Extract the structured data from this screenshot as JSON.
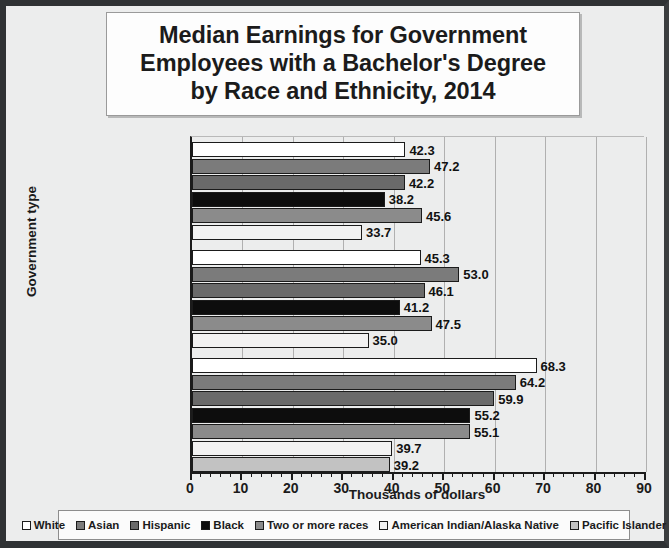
{
  "chart_data": {
    "type": "bar",
    "orientation": "horizontal",
    "title_lines": [
      "Median Earnings for Government",
      "Employees with a Bachelor's Degree",
      "by Race and Ethnicity, 2014"
    ],
    "xlabel": "Thousands of dollars",
    "ylabel": "Government type",
    "categories": [
      "State government",
      "Local government",
      "Federal government"
    ],
    "xlim": [
      0,
      90
    ],
    "xticks": [
      0,
      10,
      20,
      30,
      40,
      50,
      60,
      70,
      80,
      90
    ],
    "xtick_labels": [
      "0",
      "10",
      "20",
      "30",
      "40",
      "50",
      "60",
      "70",
      "80",
      "90"
    ],
    "minor_tick_step": 2,
    "grid": true,
    "grid_axis": "x",
    "legend_position": "bottom",
    "series": [
      {
        "name": "White",
        "color": "#ffffff",
        "values": [
          42.3,
          45.3,
          68.3
        ]
      },
      {
        "name": "Asian",
        "color": "#7b7b7b",
        "values": [
          47.2,
          53.0,
          64.2
        ]
      },
      {
        "name": "Hispanic",
        "color": "#6a6a6a",
        "values": [
          42.2,
          46.1,
          59.9
        ]
      },
      {
        "name": "Black",
        "color": "#0d0d0d",
        "values": [
          38.2,
          41.2,
          55.2
        ]
      },
      {
        "name": "Two or more races",
        "color": "#8b8b8b",
        "values": [
          45.6,
          47.5,
          55.1
        ]
      },
      {
        "name": "American Indian/Alaska Native",
        "color": "#f2f2f2",
        "values": [
          33.7,
          35.0,
          39.7
        ]
      },
      {
        "name": "Pacific Islander",
        "color": "#c2c2c2",
        "values": [
          null,
          null,
          39.2
        ]
      }
    ],
    "value_labels": {
      "State government": [
        "42.3",
        "47.2",
        "42.2",
        "38.2",
        "45.6",
        "33.7"
      ],
      "Local government": [
        "45.3",
        "53.0",
        "46.1",
        "41.2",
        "47.5",
        "35.0"
      ],
      "Federal government": [
        "68.3",
        "64.2",
        "59.9",
        "55.2",
        "55.1",
        "39.7",
        "39.2"
      ]
    }
  },
  "legend": {
    "items": [
      {
        "label": "White",
        "color": "#ffffff"
      },
      {
        "label": "Asian",
        "color": "#7b7b7b"
      },
      {
        "label": "Hispanic",
        "color": "#6a6a6a"
      },
      {
        "label": "Black",
        "color": "#0d0d0d"
      },
      {
        "label": "Two or more races",
        "color": "#8b8b8b"
      },
      {
        "label": "American Indian/Alaska Native",
        "color": "#f2f2f2"
      },
      {
        "label": "Pacific Islander",
        "color": "#c2c2c2"
      }
    ]
  }
}
